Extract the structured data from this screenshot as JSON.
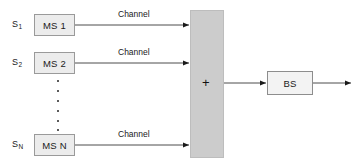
{
  "diagram": {
    "colors": {
      "node_fill": "#ececec",
      "node_border": "#9a9a9a",
      "combiner_fill": "#cccccc",
      "line": "#4d4d4d",
      "text": "#1a1a1a",
      "background": "#ffffff"
    },
    "sources": [
      {
        "label": "S",
        "subscript": "1"
      },
      {
        "label": "S",
        "subscript": "2"
      },
      {
        "label": "S",
        "subscript": "N"
      }
    ],
    "stations": [
      {
        "name": "MS 1"
      },
      {
        "name": "MS 2"
      },
      {
        "name": "MS N"
      }
    ],
    "channels": [
      {
        "label": "Channel"
      },
      {
        "label": "Channel"
      },
      {
        "label": "Channel"
      }
    ],
    "combiner": {
      "symbol": "+"
    },
    "base_station": {
      "name": "BS"
    },
    "vertical_ellipsis": {
      "dot_count": 6
    }
  }
}
